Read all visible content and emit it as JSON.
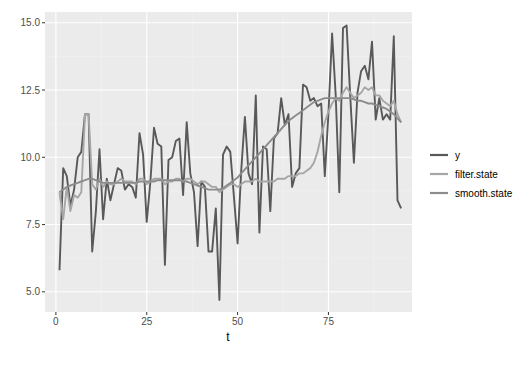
{
  "chart_data": {
    "type": "line",
    "title": "",
    "xlabel": "t",
    "ylabel": "",
    "xlim": [
      -3,
      98
    ],
    "ylim": [
      4.25,
      15.4
    ],
    "x_ticks": [
      0,
      25,
      50,
      75
    ],
    "x_tick_labels": [
      "0",
      "25",
      "50",
      "75"
    ],
    "y_ticks": [
      5.0,
      7.5,
      10.0,
      12.5,
      15.0
    ],
    "y_tick_labels": [
      "5.0",
      "7.5",
      "10.0",
      "12.5",
      "15.0"
    ],
    "grid": true,
    "legend_position": "right",
    "x": [
      1,
      2,
      3,
      4,
      5,
      6,
      7,
      8,
      9,
      10,
      11,
      12,
      13,
      14,
      15,
      16,
      17,
      18,
      19,
      20,
      21,
      22,
      23,
      24,
      25,
      26,
      27,
      28,
      29,
      30,
      31,
      32,
      33,
      34,
      35,
      36,
      37,
      38,
      39,
      40,
      41,
      42,
      43,
      44,
      45,
      46,
      47,
      48,
      49,
      50,
      51,
      52,
      53,
      54,
      55,
      56,
      57,
      58,
      59,
      60,
      61,
      62,
      63,
      64,
      65,
      66,
      67,
      68,
      69,
      70,
      71,
      72,
      73,
      74,
      75,
      76,
      77,
      78,
      79,
      80,
      81,
      82,
      83,
      84,
      85,
      86,
      87,
      88,
      89,
      90,
      91,
      92,
      93,
      94,
      95
    ],
    "series": [
      {
        "name": "y",
        "color": "#595959",
        "values": [
          5.8,
          9.6,
          9.3,
          8.2,
          8.8,
          10.0,
          10.2,
          11.6,
          11.6,
          6.5,
          8.0,
          10.3,
          7.7,
          9.2,
          8.4,
          9.0,
          9.6,
          9.5,
          8.8,
          9.0,
          8.9,
          8.5,
          10.9,
          10.1,
          7.6,
          9.1,
          11.1,
          10.5,
          10.4,
          6.0,
          9.9,
          10.0,
          10.6,
          10.7,
          8.6,
          11.3,
          9.4,
          8.7,
          6.7,
          9.1,
          8.9,
          6.5,
          6.5,
          8.1,
          4.7,
          10.1,
          10.4,
          10.2,
          8.5,
          6.8,
          9.5,
          11.5,
          9.4,
          9.0,
          12.3,
          7.2,
          10.4,
          10.3,
          8.0,
          10.7,
          10.9,
          12.2,
          11.2,
          11.6,
          8.9,
          9.4,
          9.6,
          12.7,
          12.6,
          12.1,
          12.2,
          11.9,
          12.0,
          9.3,
          11.6,
          14.6,
          12.3,
          8.7,
          14.8,
          14.9,
          12.3,
          9.8,
          12.4,
          13.2,
          13.4,
          12.9,
          14.3,
          11.4,
          12.2,
          11.4,
          11.6,
          11.4,
          14.5,
          8.4,
          8.1
        ]
      },
      {
        "name": "filter.state",
        "color": "#a6a6a6",
        "values": [
          8.7,
          7.7,
          8.9,
          8.0,
          8.6,
          8.5,
          8.7,
          11.6,
          11.6,
          9.0,
          8.8,
          9.2,
          8.9,
          9.1,
          9.0,
          9.0,
          9.1,
          9.2,
          9.1,
          9.1,
          9.1,
          9.0,
          9.2,
          9.2,
          9.0,
          9.1,
          9.2,
          9.2,
          9.2,
          9.0,
          9.1,
          9.1,
          9.2,
          9.2,
          9.1,
          9.2,
          9.2,
          9.1,
          9.0,
          9.1,
          9.1,
          9.0,
          8.9,
          8.9,
          8.7,
          8.8,
          8.9,
          9.0,
          9.0,
          8.9,
          9.0,
          9.1,
          9.1,
          9.1,
          9.2,
          9.1,
          9.1,
          9.1,
          9.1,
          9.1,
          9.2,
          9.2,
          9.2,
          9.3,
          9.3,
          9.3,
          9.4,
          9.4,
          9.5,
          9.6,
          9.8,
          10.2,
          10.8,
          11.3,
          11.7,
          12.0,
          12.2,
          12.1,
          12.4,
          12.6,
          12.4,
          12.2,
          12.3,
          12.4,
          12.6,
          12.5,
          12.6,
          12.3,
          12.3,
          12.1,
          12.0,
          11.9,
          12.1,
          11.6,
          11.3
        ]
      },
      {
        "name": "smooth.state",
        "color": "#8c8c8c",
        "values": [
          8.7,
          8.8,
          8.9,
          8.95,
          9.0,
          9.05,
          9.1,
          9.15,
          9.2,
          9.2,
          9.15,
          9.1,
          9.05,
          9.05,
          9.05,
          9.05,
          9.05,
          9.05,
          9.05,
          9.05,
          9.05,
          9.05,
          9.1,
          9.1,
          9.1,
          9.1,
          9.1,
          9.15,
          9.15,
          9.15,
          9.15,
          9.15,
          9.15,
          9.15,
          9.1,
          9.1,
          9.05,
          9.0,
          8.95,
          8.9,
          8.85,
          8.8,
          8.8,
          8.8,
          8.8,
          8.85,
          8.95,
          9.05,
          9.15,
          9.25,
          9.4,
          9.55,
          9.7,
          9.85,
          10.0,
          10.15,
          10.3,
          10.45,
          10.6,
          10.75,
          10.9,
          11.05,
          11.2,
          11.35,
          11.45,
          11.55,
          11.65,
          11.75,
          11.85,
          11.95,
          12.05,
          12.1,
          12.15,
          12.2,
          12.2,
          12.2,
          12.2,
          12.2,
          12.2,
          12.2,
          12.2,
          12.15,
          12.1,
          12.1,
          12.05,
          12.0,
          12.0,
          11.95,
          11.9,
          11.85,
          11.8,
          11.7,
          11.6,
          11.45,
          11.3
        ]
      }
    ]
  },
  "legend": {
    "items": [
      {
        "label": "y",
        "color": "#595959"
      },
      {
        "label": "filter.state",
        "color": "#a6a6a6"
      },
      {
        "label": "smooth.state",
        "color": "#8c8c8c"
      }
    ]
  },
  "theme": {
    "panel_bg": "#ebebeb",
    "grid_major": "#ffffff",
    "grid_minor": "#f2f2f2",
    "tick_color": "#333333"
  }
}
